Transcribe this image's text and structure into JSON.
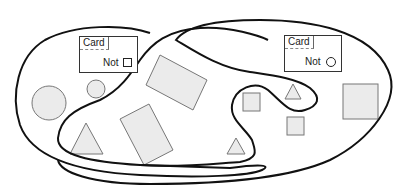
{
  "diagram": {
    "type": "venn-like set diagram",
    "colors": {
      "shape_fill": "#ebebeb",
      "shape_stroke": "#777777",
      "set_outline": "#111111",
      "background": "#ffffff"
    },
    "cards": [
      {
        "title": "Card",
        "label": "Not",
        "symbol": "square"
      },
      {
        "title": "Card",
        "label": "Not",
        "symbol": "circle"
      }
    ],
    "sets": [
      {
        "name": "left-region",
        "description": "Closed curve enclosing the left part"
      },
      {
        "name": "right-region",
        "description": "Closed curve enclosing the right part with inward S-shaped bulge"
      }
    ],
    "shapes": [
      {
        "type": "circle",
        "size": "large"
      },
      {
        "type": "circle",
        "size": "small"
      },
      {
        "type": "rectangle",
        "rotated": true
      },
      {
        "type": "triangle"
      },
      {
        "type": "rectangle",
        "rotated": true
      },
      {
        "type": "square",
        "size": "small"
      },
      {
        "type": "triangle",
        "size": "small"
      },
      {
        "type": "square",
        "size": "small"
      },
      {
        "type": "triangle",
        "size": "small"
      },
      {
        "type": "square",
        "size": "large"
      }
    ]
  }
}
